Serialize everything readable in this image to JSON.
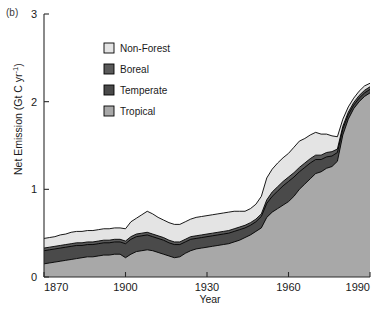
{
  "panel": {
    "label": "(b)"
  },
  "axes": {
    "y": {
      "title": "Net Emission (Gt C yr",
      "title_sup": "-1",
      "title_close": ")",
      "title_full": "Net Emission (Gt C yr-1)",
      "ticks": [
        "0",
        "1",
        "2",
        "3"
      ],
      "tick_values": [
        0,
        1,
        2,
        3
      ],
      "min": 0,
      "max": 3
    },
    "x": {
      "title": "Year",
      "ticks": [
        "1870",
        "1900",
        "1930",
        "1960",
        "1990"
      ],
      "tick_values": [
        1870,
        1900,
        1930,
        1960,
        1990
      ],
      "min": 1870,
      "max": 1990
    }
  },
  "legend": {
    "items": [
      {
        "label": "Non-Forest",
        "color": "#e4e4e4"
      },
      {
        "label": "Boreal",
        "color": "#5a5a5a"
      },
      {
        "label": "Temperate",
        "color": "#4a4a4a"
      },
      {
        "label": "Tropical",
        "color": "#a8a8a8"
      }
    ]
  },
  "colors": {
    "non_forest": "#e4e4e4",
    "boreal": "#5a5a5a",
    "temperate": "#4a4a4a",
    "tropical": "#a8a8a8",
    "outline": "#000000",
    "axis": "#2a2a2a",
    "background": "#ffffff"
  },
  "chart_data": {
    "type": "area",
    "title": "",
    "subtitle": "",
    "panel_label": "(b)",
    "xlabel": "Year",
    "ylabel": "Net Emission (Gt C yr-1)",
    "xlim": [
      1870,
      1990
    ],
    "ylim": [
      0,
      3
    ],
    "grid": false,
    "stacked": true,
    "legend_position": "upper-left-inside",
    "stack_order_bottom_to_top": [
      "Tropical",
      "Temperate",
      "Boreal",
      "Non-Forest"
    ],
    "x": [
      1870,
      1872,
      1874,
      1876,
      1878,
      1880,
      1882,
      1884,
      1886,
      1888,
      1890,
      1892,
      1894,
      1896,
      1898,
      1900,
      1902,
      1904,
      1906,
      1908,
      1910,
      1912,
      1914,
      1916,
      1918,
      1920,
      1922,
      1924,
      1926,
      1928,
      1930,
      1932,
      1934,
      1936,
      1938,
      1940,
      1942,
      1944,
      1946,
      1948,
      1950,
      1952,
      1954,
      1956,
      1958,
      1960,
      1962,
      1964,
      1966,
      1968,
      1970,
      1972,
      1974,
      1976,
      1978,
      1980,
      1982,
      1984,
      1986,
      1988,
      1990
    ],
    "series": [
      {
        "name": "Tropical",
        "values": [
          0.15,
          0.16,
          0.17,
          0.18,
          0.19,
          0.2,
          0.21,
          0.22,
          0.23,
          0.23,
          0.24,
          0.25,
          0.25,
          0.26,
          0.26,
          0.22,
          0.26,
          0.29,
          0.3,
          0.31,
          0.3,
          0.28,
          0.26,
          0.24,
          0.22,
          0.23,
          0.27,
          0.3,
          0.32,
          0.33,
          0.34,
          0.35,
          0.36,
          0.37,
          0.38,
          0.4,
          0.42,
          0.45,
          0.48,
          0.52,
          0.56,
          0.68,
          0.74,
          0.78,
          0.82,
          0.86,
          0.92,
          1.0,
          1.06,
          1.12,
          1.18,
          1.2,
          1.24,
          1.26,
          1.32,
          1.62,
          1.8,
          1.92,
          2.0,
          2.06,
          2.1
        ]
      },
      {
        "name": "Temperate",
        "values": [
          0.15,
          0.15,
          0.15,
          0.15,
          0.15,
          0.15,
          0.15,
          0.14,
          0.14,
          0.14,
          0.14,
          0.14,
          0.14,
          0.14,
          0.14,
          0.16,
          0.17,
          0.17,
          0.17,
          0.17,
          0.16,
          0.16,
          0.16,
          0.15,
          0.15,
          0.14,
          0.13,
          0.13,
          0.12,
          0.12,
          0.12,
          0.12,
          0.12,
          0.12,
          0.12,
          0.12,
          0.12,
          0.11,
          0.11,
          0.11,
          0.13,
          0.16,
          0.18,
          0.2,
          0.22,
          0.23,
          0.22,
          0.2,
          0.19,
          0.18,
          0.16,
          0.14,
          0.13,
          0.12,
          0.1,
          0.07,
          0.05,
          0.04,
          0.04,
          0.04,
          0.04
        ]
      },
      {
        "name": "Boreal",
        "values": [
          0.03,
          0.03,
          0.03,
          0.03,
          0.03,
          0.03,
          0.03,
          0.03,
          0.03,
          0.03,
          0.03,
          0.03,
          0.03,
          0.03,
          0.03,
          0.03,
          0.03,
          0.03,
          0.03,
          0.03,
          0.03,
          0.03,
          0.03,
          0.03,
          0.03,
          0.03,
          0.03,
          0.03,
          0.03,
          0.03,
          0.03,
          0.03,
          0.03,
          0.03,
          0.03,
          0.03,
          0.03,
          0.03,
          0.03,
          0.03,
          0.03,
          0.04,
          0.05,
          0.05,
          0.05,
          0.05,
          0.05,
          0.05,
          0.05,
          0.05,
          0.05,
          0.05,
          0.05,
          0.05,
          0.04,
          0.03,
          0.03,
          0.03,
          0.03,
          0.03,
          0.03
        ]
      },
      {
        "name": "Non-Forest",
        "values": [
          0.11,
          0.11,
          0.11,
          0.12,
          0.12,
          0.13,
          0.13,
          0.13,
          0.13,
          0.13,
          0.13,
          0.13,
          0.13,
          0.13,
          0.13,
          0.14,
          0.17,
          0.18,
          0.21,
          0.24,
          0.23,
          0.21,
          0.2,
          0.2,
          0.2,
          0.2,
          0.2,
          0.2,
          0.21,
          0.21,
          0.21,
          0.21,
          0.21,
          0.21,
          0.21,
          0.2,
          0.18,
          0.16,
          0.16,
          0.17,
          0.2,
          0.25,
          0.26,
          0.27,
          0.27,
          0.27,
          0.29,
          0.3,
          0.28,
          0.27,
          0.26,
          0.24,
          0.21,
          0.18,
          0.14,
          0.08,
          0.06,
          0.05,
          0.05,
          0.05,
          0.04
        ]
      }
    ]
  }
}
